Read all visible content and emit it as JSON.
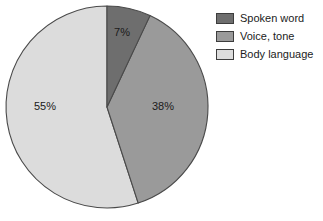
{
  "chart_data": {
    "type": "pie",
    "title": "",
    "categories": [
      "Spoken word",
      "Voice, tone",
      "Body language"
    ],
    "values": [
      7,
      38,
      55
    ],
    "value_labels": [
      "7%",
      "38%",
      "55%"
    ],
    "unit": "%",
    "legend_position": "right",
    "grid": false,
    "start_angle_deg": 0,
    "direction": "clockwise",
    "colors": [
      "#6e6e6e",
      "#9a9a9a",
      "#dcdcdc"
    ],
    "stroke_color": "#4a4a4a",
    "background": "#ffffff"
  },
  "legend": {
    "items": [
      {
        "label": "Spoken word",
        "color": "#6e6e6e"
      },
      {
        "label": "Voice, tone",
        "color": "#9a9a9a"
      },
      {
        "label": "Body language",
        "color": "#dcdcdc"
      }
    ]
  },
  "pie": {
    "labels": [
      {
        "text": "7%",
        "x": 122,
        "y": 36
      },
      {
        "text": "38%",
        "x": 163,
        "y": 110
      },
      {
        "text": "55%",
        "x": 45,
        "y": 110
      }
    ]
  }
}
